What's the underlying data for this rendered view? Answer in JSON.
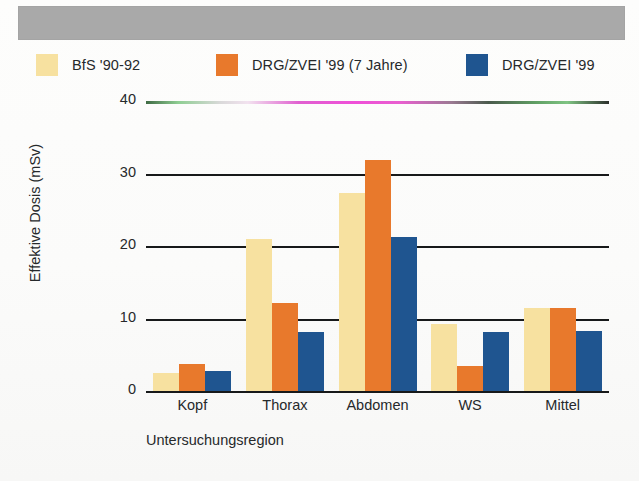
{
  "banner": {
    "present": true,
    "color": "#a9a9a9"
  },
  "legend": {
    "items": [
      {
        "label": "BfS '90-92",
        "color": "#f7e1a0",
        "swatch_name": "legend-swatch-bfs"
      },
      {
        "label": "DRG/ZVEI '99 (7 Jahre)",
        "color": "#e8792c",
        "swatch_name": "legend-swatch-drg-7jahre"
      },
      {
        "label": "DRG/ZVEI '99",
        "color": "#1f5590",
        "swatch_name": "legend-swatch-drg"
      }
    ]
  },
  "axes": {
    "y_title": "Effektive Dosis (mSv)",
    "x_title": "Untersuchungsregion",
    "y_ticks": [
      "0",
      "10",
      "20",
      "30",
      "40"
    ]
  },
  "chart_data": {
    "type": "bar",
    "title": "",
    "xlabel": "Untersuchungsregion",
    "ylabel": "Effektive Dosis (mSv)",
    "categories": [
      "Kopf",
      "Thorax",
      "Abdomen",
      "WS",
      "Mittel"
    ],
    "series": [
      {
        "name": "BfS '90-92",
        "color": "#f7e1a0",
        "values": [
          2.5,
          20.9,
          27.3,
          9.2,
          11.4
        ]
      },
      {
        "name": "DRG/ZVEI '99 (7 Jahre)",
        "color": "#e8792c",
        "values": [
          3.7,
          12.1,
          31.9,
          3.4,
          11.4
        ]
      },
      {
        "name": "DRG/ZVEI '99",
        "color": "#1f5590",
        "values": [
          2.8,
          8.1,
          21.2,
          8.2,
          8.3
        ]
      }
    ],
    "ylim": [
      0,
      40
    ],
    "yticks": [
      0,
      10,
      20,
      30,
      40
    ],
    "grid": true,
    "grid_axis": "y",
    "legend_position": "top"
  }
}
